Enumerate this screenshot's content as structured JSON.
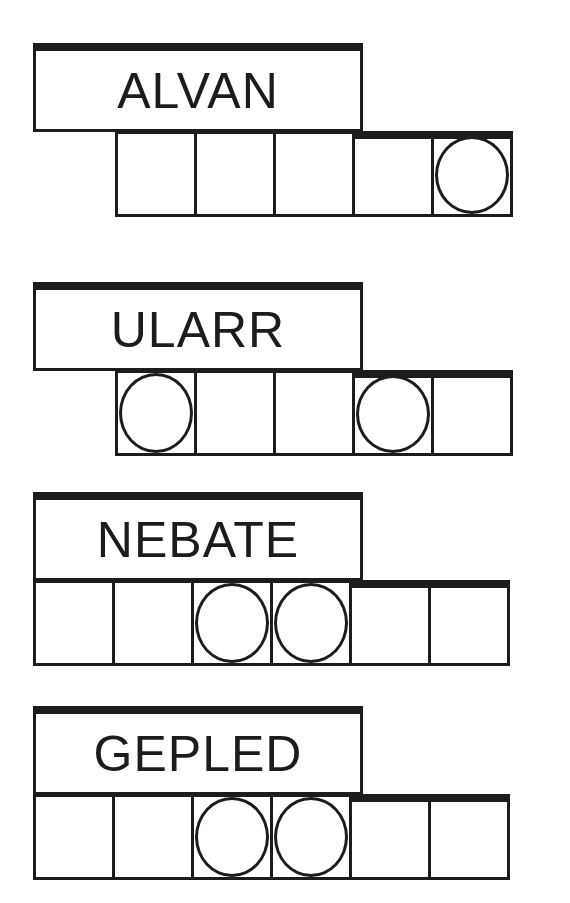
{
  "puzzles": [
    {
      "scrambled": "ALVAN",
      "letters": 5,
      "circled_positions": [
        5
      ],
      "tiles": [
        "",
        "",
        "",
        "",
        ""
      ]
    },
    {
      "scrambled": "ULARR",
      "letters": 5,
      "circled_positions": [
        1,
        4
      ],
      "tiles": [
        "",
        "",
        "",
        "",
        ""
      ]
    },
    {
      "scrambled": "NEBATE",
      "letters": 6,
      "circled_positions": [
        3,
        4
      ],
      "tiles": [
        "",
        "",
        "",
        "",
        "",
        ""
      ]
    },
    {
      "scrambled": "GEPLED",
      "letters": 6,
      "circled_positions": [
        3,
        4
      ],
      "tiles": [
        "",
        "",
        "",
        "",
        "",
        ""
      ]
    }
  ],
  "colors": {
    "ink": "#1c1c1c",
    "background": "#ffffff"
  }
}
